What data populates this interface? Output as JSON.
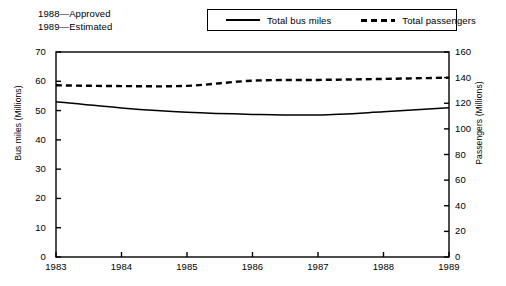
{
  "note": {
    "lines": [
      "1988—Approved",
      "1989—Estimated"
    ]
  },
  "legend": {
    "items": [
      {
        "label": "Total bus miles",
        "style": "solid",
        "icon": "solid-line-icon"
      },
      {
        "label": "Total passengers",
        "style": "dashed",
        "icon": "dashed-line-icon"
      }
    ]
  },
  "chart_data": {
    "type": "line",
    "title": "",
    "xlabel": "",
    "x": [
      1983,
      1984,
      1985,
      1986,
      1987,
      1988,
      1989
    ],
    "xticklabels": [
      "1983",
      "1984",
      "1985",
      "1986",
      "1987",
      "1988",
      "1989"
    ],
    "xlim": [
      1983,
      1989
    ],
    "grid": false,
    "legend_position": "top-right",
    "axes": [
      {
        "id": "left",
        "label": "Bus miles (Millions)",
        "lim": [
          0,
          70
        ],
        "ticks": [
          0,
          10,
          20,
          30,
          40,
          50,
          60,
          70
        ],
        "ticklabels": [
          "0",
          "10",
          "20",
          "30",
          "40",
          "50",
          "60",
          "70"
        ]
      },
      {
        "id": "right",
        "label": "Passengers (Millions)",
        "lim": [
          0,
          160
        ],
        "ticks": [
          0,
          20,
          40,
          60,
          80,
          100,
          120,
          140,
          160
        ],
        "ticklabels": [
          "0",
          "20",
          "40",
          "60",
          "80",
          "100",
          "120",
          "140",
          "160"
        ]
      }
    ],
    "series": [
      {
        "name": "Total bus miles",
        "axis": "left",
        "style": "solid",
        "values": [
          53.0,
          50.9,
          49.4,
          48.7,
          48.5,
          49.6,
          51.0
        ]
      },
      {
        "name": "Total passengers",
        "axis": "right",
        "style": "dashed",
        "values": [
          134.0,
          133.4,
          133.6,
          137.6,
          138.2,
          139.0,
          140.0
        ]
      }
    ],
    "annotations": [
      "1988—Approved",
      "1989—Estimated"
    ]
  },
  "caption": {
    "text": ""
  }
}
